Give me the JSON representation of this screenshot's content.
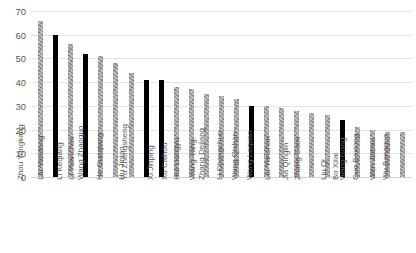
{
  "chart_data": {
    "type": "bar",
    "title": "",
    "xlabel": "",
    "ylabel": "",
    "ylim": [
      0,
      70
    ],
    "yticks": [
      70,
      60,
      50,
      40,
      30,
      20,
      10,
      0
    ],
    "grid": true,
    "legend": "none",
    "bar_colors": {
      "default": "#bfbfbf",
      "highlight": "#000000"
    },
    "categories": [
      "Zhou Yongkang",
      "Liu Yandong",
      "Li Keqiang",
      "Li Yuanchao",
      "Wang Zhaoguo",
      "He Guoqiang",
      "Hu Jintao",
      "Yu Zhengsheng",
      "Xi Jinping",
      "Xu Caihou",
      "Hui Liangyu",
      "Wang Yang",
      "Zhang Dejiang",
      "Li Changchun",
      "Wang Qishan",
      "Wang Lequan",
      "Liu Yunshan",
      "Jia Qinglin",
      "Zhang Gaoli",
      "Liu Qi",
      "Bo Xilai",
      "Wang Gang",
      "Guo Boxiong",
      "Wen Jiabao",
      "Wu Bangguo"
    ],
    "values": [
      66,
      60,
      56,
      52,
      51,
      48,
      44,
      41,
      41,
      38,
      37,
      35,
      34,
      33,
      30,
      30,
      29,
      28,
      27,
      26,
      24,
      21,
      20,
      19,
      19
    ],
    "highlighted": [
      false,
      true,
      false,
      true,
      false,
      false,
      false,
      true,
      true,
      false,
      false,
      false,
      false,
      false,
      true,
      false,
      false,
      false,
      false,
      false,
      true,
      false,
      false,
      false,
      false
    ]
  }
}
